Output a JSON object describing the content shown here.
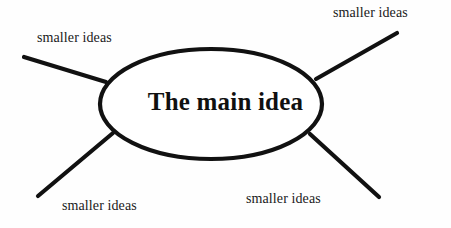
{
  "diagram": {
    "type": "mind-map",
    "title": "",
    "background_color": "#fefefe",
    "stroke_color": "#111111",
    "text_color": "#1a1a1a",
    "center": {
      "label": "The main idea",
      "shape": "ellipse",
      "cx": 211,
      "cy": 104,
      "rx": 111,
      "ry": 55
    },
    "branches": [
      {
        "id": "top-left",
        "label": "smaller ideas",
        "line": {
          "x1": 24,
          "y1": 57,
          "x2": 106,
          "y2": 82
        }
      },
      {
        "id": "top-right",
        "label": "smaller ideas",
        "line": {
          "x1": 316,
          "y1": 79,
          "x2": 397,
          "y2": 33
        }
      },
      {
        "id": "bottom-left",
        "label": "smaller ideas",
        "line": {
          "x1": 113,
          "y1": 133,
          "x2": 38,
          "y2": 196
        }
      },
      {
        "id": "bottom-right",
        "label": "smaller ideas",
        "line": {
          "x1": 310,
          "y1": 134,
          "x2": 379,
          "y2": 197
        }
      }
    ]
  }
}
